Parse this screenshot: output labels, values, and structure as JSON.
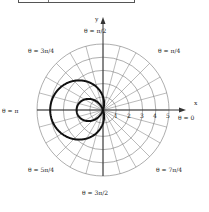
{
  "figure": {
    "equation": "r = 1 − 3cos θ",
    "curve_type": "limaçon with inner loop",
    "axis_labels": {
      "x": "x",
      "y": "y"
    },
    "angle_labels": [
      {
        "id": "theta-0",
        "text": "θ = 0"
      },
      {
        "id": "theta-pi-4",
        "text": "θ = π/4"
      },
      {
        "id": "theta-pi-2",
        "text": "θ = π/2"
      },
      {
        "id": "theta-3pi-4",
        "text": "θ = 3π/4"
      },
      {
        "id": "theta-pi",
        "text": "θ = π"
      },
      {
        "id": "theta-5pi-4",
        "text": "θ = 5π/4"
      },
      {
        "id": "theta-3pi-2",
        "text": "θ = 3π/2"
      },
      {
        "id": "theta-7pi-4",
        "text": "θ = 7π/4"
      }
    ],
    "radial_ticks": [
      "1",
      "2",
      "3",
      "4",
      "5"
    ],
    "grid": {
      "circles": 5,
      "radial_lines_every_deg": 15
    },
    "colors": {
      "grid": "#777777",
      "curve": "#111111",
      "axis": "#333333"
    }
  }
}
